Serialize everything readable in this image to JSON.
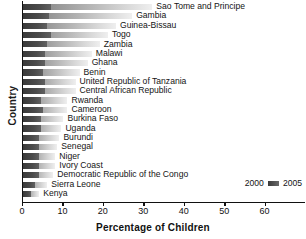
{
  "chart_data": {
    "type": "bar",
    "orientation": "horizontal",
    "title": "",
    "xlabel": "Percentage of Children",
    "ylabel": "Country",
    "xlim": [
      0,
      70
    ],
    "xticks": [
      0,
      10,
      20,
      30,
      40,
      50,
      60
    ],
    "xticklabels": [
      "0",
      "10",
      "20",
      "30",
      "40",
      "50",
      "60"
    ],
    "grid": false,
    "legend_position": "bottom-right",
    "categories": [
      "Sao Tome and Principe",
      "Gambia",
      "Guinea-Bissau",
      "Togo",
      "Zambia",
      "Malawi",
      "Ghana",
      "Benin",
      "United Republic of Tanzania",
      "Central African Republic",
      "Rwanda",
      "Cameroon",
      "Burkina Faso",
      "Uganda",
      "Burundi",
      "Senegal",
      "Niger",
      "Ivory Coast",
      "Democratic Republic of the Congo",
      "Sierra Leone",
      "Kenya"
    ],
    "series": [
      {
        "name": "2000",
        "values": [
          32,
          27,
          23,
          21,
          19,
          17,
          16,
          14,
          13,
          13,
          11,
          11,
          10,
          9.5,
          9,
          8.5,
          8,
          8,
          7.5,
          6,
          4
        ]
      },
      {
        "name": "2005",
        "values": [
          7,
          6.5,
          6,
          7,
          6,
          5.5,
          5.5,
          5,
          5.5,
          5.5,
          4.5,
          5,
          4.5,
          4.5,
          4,
          4,
          4,
          4,
          4,
          3,
          2
        ]
      }
    ],
    "legend": [
      "2000",
      "2005"
    ]
  },
  "legend": {
    "left_label": "2000",
    "right_label": "2005",
    "swatch": "bar-swatch"
  }
}
